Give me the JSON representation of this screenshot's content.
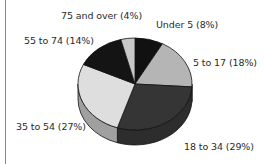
{
  "chart_data": {
    "type": "pie",
    "title": "",
    "style": "3d",
    "start_angle": "12 o'clock, clockwise",
    "categories": [
      "Under 5",
      "5 to 17",
      "18 to 34",
      "35 to 54",
      "55 to 74",
      "75 and over"
    ],
    "values": [
      8,
      18,
      29,
      27,
      14,
      4
    ],
    "unit": "%",
    "colors": [
      "#111111",
      "#b5b5b5",
      "#353535",
      "#dedede",
      "#141414",
      "#c8c8c8"
    ],
    "labels": [
      "Under 5  (8%)",
      "5 to 17 (18%)",
      "18 to 34 (29%)",
      "35 to 54 (27%)",
      "55 to 74 (14%)",
      "75 and over (4%)"
    ],
    "legend": "none (direct labels)"
  }
}
